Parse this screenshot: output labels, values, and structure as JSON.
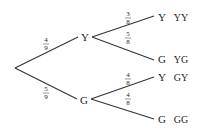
{
  "diagram": {
    "type": "probability-tree",
    "root": "",
    "level1": [
      {
        "label": "Y",
        "prob_num": "4",
        "prob_den": "9"
      },
      {
        "label": "G",
        "prob_num": "5",
        "prob_den": "9"
      }
    ],
    "level2": [
      {
        "parent": "Y",
        "label": "Y",
        "prob_num": "3",
        "prob_den": "8",
        "outcome": "YY"
      },
      {
        "parent": "Y",
        "label": "G",
        "prob_num": "5",
        "prob_den": "8",
        "outcome": "YG"
      },
      {
        "parent": "G",
        "label": "Y",
        "prob_num": "4",
        "prob_den": "8",
        "outcome": "GY"
      },
      {
        "parent": "G",
        "label": "G",
        "prob_num": "4",
        "prob_den": "8",
        "outcome": "GG"
      }
    ]
  }
}
